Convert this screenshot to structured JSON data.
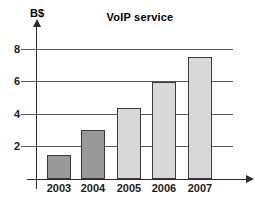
{
  "chart_data": {
    "type": "bar",
    "title": "VoIP service",
    "ylabel": "B$",
    "xlabel": "",
    "categories": [
      "2003",
      "2004",
      "2005",
      "2006",
      "2007"
    ],
    "values": [
      1.5,
      3,
      4.4,
      6,
      7.5
    ],
    "yticks": [
      2,
      4,
      6,
      8
    ],
    "ylim": [
      0,
      9
    ],
    "grid": true,
    "legend": "none",
    "bar_colors": [
      "#999999",
      "#999999",
      "#d8d8d8",
      "#d8d8d8",
      "#d8d8d8"
    ],
    "colors": {
      "bar_border": "#3a3a3a",
      "axis": "#2b2b2b",
      "gridline": "#5a5a5a",
      "text": "#1c1c1c",
      "background": "#ffffff"
    }
  }
}
